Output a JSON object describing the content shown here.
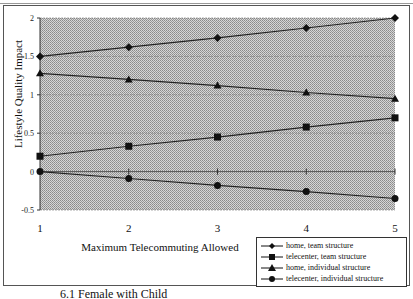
{
  "chart_data": {
    "type": "line",
    "title": "",
    "xlabel": "Maximum Telecommuting Allowed",
    "ylabel": "Lifestyle Quality Impact",
    "x": [
      1,
      2,
      3,
      4,
      5
    ],
    "x_tick_labels": [
      "1",
      "2",
      "3",
      "4",
      "5"
    ],
    "y_tick_labels": [
      "-0.5",
      "0",
      "0.5",
      "1",
      "1.5",
      "2"
    ],
    "ylim": [
      -0.5,
      2
    ],
    "grid": true,
    "legend_position": "bottom-right",
    "series": [
      {
        "name": "home, team structure",
        "marker": "diamond",
        "values": [
          1.5,
          1.62,
          1.74,
          1.87,
          2.0
        ]
      },
      {
        "name": "telecenter, team structure",
        "marker": "square",
        "values": [
          0.2,
          0.33,
          0.45,
          0.58,
          0.7
        ]
      },
      {
        "name": "home, individual structure",
        "marker": "triangle",
        "values": [
          1.28,
          1.2,
          1.12,
          1.03,
          0.95
        ]
      },
      {
        "name": "telecenter, individual structure",
        "marker": "circle",
        "values": [
          0.0,
          -0.09,
          -0.18,
          -0.26,
          -0.35
        ]
      }
    ]
  },
  "caption": "6.1     Female with Child"
}
